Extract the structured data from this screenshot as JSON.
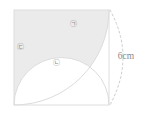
{
  "figure": {
    "type": "geometry-diagram",
    "square": {
      "side_label": "6cm",
      "side_length_cm": 6,
      "x": 14,
      "y": 10,
      "size": 95,
      "stroke": "#d9d9d9",
      "fill": "#ffffff"
    },
    "shading": {
      "fill": "#ebebeb",
      "stroke": "#dcdcdc"
    },
    "arcs": [
      {
        "name": "quarter-arc",
        "center": "bottom-right-corner",
        "radius": 95,
        "style": "solid"
      },
      {
        "name": "semicircle-arc",
        "center": "bottom-edge-midpoint",
        "radius": 47.5,
        "style": "solid"
      },
      {
        "name": "dimension-arc",
        "style": "dashed",
        "stroke": "#c8c8c8"
      }
    ],
    "labels": [
      {
        "id": "region-a",
        "text": "㉠",
        "x": 73,
        "y": 24
      },
      {
        "id": "region-b",
        "text": "㉡",
        "x": 56,
        "y": 63
      },
      {
        "id": "region-c",
        "text": "㉢",
        "x": 20,
        "y": 47
      }
    ],
    "dimension": {
      "id": "side-dimension",
      "text": "6cm",
      "x": 126,
      "y": 57
    }
  }
}
